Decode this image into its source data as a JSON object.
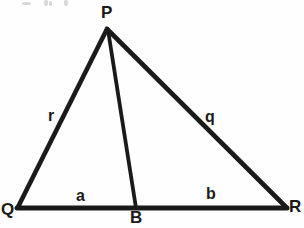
{
  "figure": {
    "type": "geometry-diagram",
    "width": 304,
    "height": 228,
    "background_color": "#fefefe",
    "stroke_color": "#1a1a1a",
    "stroke_width": 4
  },
  "points": {
    "P": {
      "label": "P",
      "x": 107,
      "y": 28
    },
    "Q": {
      "label": "Q",
      "x": 18,
      "y": 208
    },
    "R": {
      "label": "R",
      "x": 286,
      "y": 208
    },
    "B": {
      "label": "B",
      "x": 136,
      "y": 208
    }
  },
  "segments": [
    {
      "name": "side-QP",
      "from": "Q",
      "to": "P",
      "label": "r"
    },
    {
      "name": "side-PR",
      "from": "P",
      "to": "R",
      "label": "q"
    },
    {
      "name": "base-QB",
      "from": "Q",
      "to": "B",
      "label": "a"
    },
    {
      "name": "base-BR",
      "from": "B",
      "to": "R",
      "label": "b"
    },
    {
      "name": "cevian-PB",
      "from": "P",
      "to": "B",
      "label": ""
    }
  ],
  "labels": {
    "vertex_P": "P",
    "vertex_Q": "Q",
    "vertex_R": "R",
    "point_B": "B",
    "side_r": "r",
    "side_q": "q",
    "segment_a": "a",
    "segment_b": "b"
  }
}
